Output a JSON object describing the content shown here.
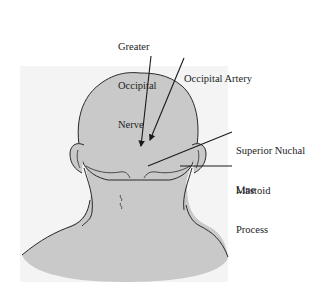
{
  "figure": {
    "colors": {
      "skin": "#c9c9c9",
      "outline": "#2a2a2a",
      "panel": "#f4f4f4",
      "text": "#222222"
    }
  },
  "labels": {
    "greater_occipital_nerve": {
      "line1": "Greater",
      "line2": "Occipital",
      "line3": "Nerve"
    },
    "occipital_artery": {
      "line1": "Occipital Artery"
    },
    "superior_nuchal_line": {
      "line1": "Superior Nuchal",
      "line2": "Line"
    },
    "mastoid_process": {
      "line1": "Mastoid",
      "line2": "Process"
    }
  }
}
